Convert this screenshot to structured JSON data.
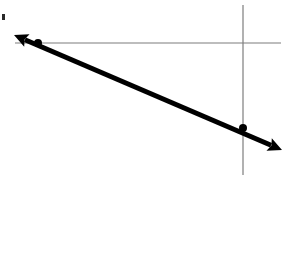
{
  "figure": {
    "title": "Graph of a decreasing linear function on a coordinate plane",
    "background_color": "#ffffff",
    "width": 286,
    "height": 254
  },
  "chart_data": {
    "type": "line",
    "title": "",
    "subtitle": "",
    "xlabel": "",
    "ylabel": "",
    "grid": false,
    "legend_position": "none",
    "axes": {
      "x_axis": {
        "name": "x-axis",
        "orientation": "horizontal",
        "color": "#7d7d7d",
        "thickness": 1,
        "x_start": 15,
        "x_end": 281,
        "y": 43,
        "tick_labels": [],
        "arrowheads": false
      },
      "y_axis": {
        "name": "y-axis",
        "orientation": "vertical",
        "color": "#7d7d7d",
        "thickness": 1,
        "y_start": 5,
        "y_end": 175,
        "x": 243,
        "tick_labels": [],
        "arrowheads": false
      },
      "origin": {
        "x": 243,
        "y": 43
      }
    },
    "series": [
      {
        "name": "line",
        "color": "#000000",
        "thickness": 5,
        "style": "solid",
        "slope_sign": "negative",
        "double_arrow": true,
        "x": [
          14,
          282
        ],
        "y": [
          35,
          150
        ],
        "endpoints": {
          "start": {
            "x": 14,
            "y": 35,
            "arrowhead": "left-up"
          },
          "end": {
            "x": 282,
            "y": 150,
            "arrowhead": "right-down"
          }
        }
      }
    ],
    "points": [
      {
        "name": "x-intercept",
        "label": "",
        "x": 38,
        "y": 43,
        "radius": 4,
        "color": "#000000",
        "filled": true
      },
      {
        "name": "y-intercept",
        "label": "",
        "x": 243,
        "y": 128,
        "radius": 4,
        "color": "#000000",
        "filled": true
      }
    ],
    "annotations": [
      {
        "name": "edge-speck",
        "x": 2,
        "y": 14,
        "width": 3,
        "height": 6,
        "color": "#2a2a2a"
      }
    ],
    "colors": {
      "line": "#000000",
      "axis": "#7d7d7d",
      "background": "#ffffff",
      "point": "#000000"
    }
  }
}
